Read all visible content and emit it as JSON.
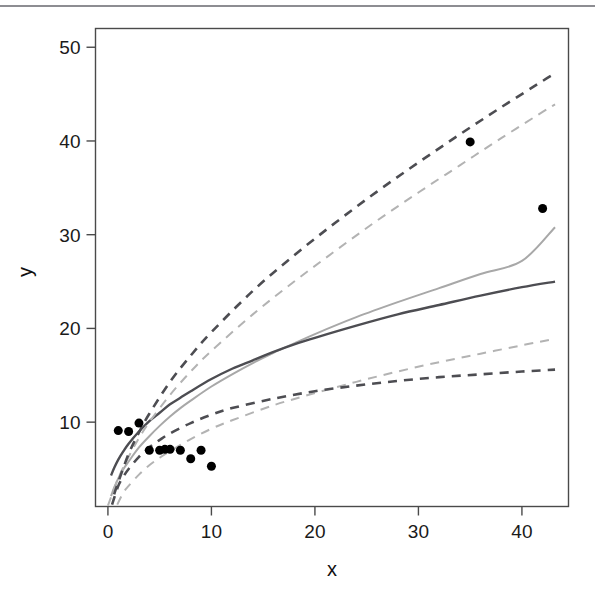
{
  "figure": {
    "background_color": "#ffffff",
    "top_rule_color": "#8d8d92",
    "plot_frame_color": "#4a4a4a"
  },
  "chart_data": {
    "type": "scatter",
    "title": "",
    "subtitle": "",
    "xlabel": "x",
    "ylabel": "y",
    "xlim": [
      -1.2,
      44.5
    ],
    "ylim": [
      1.0,
      52.0
    ],
    "xticks": [
      0,
      10,
      20,
      30,
      40
    ],
    "xticklabels": [
      "0",
      "10",
      "20",
      "30",
      "40"
    ],
    "yticks": [
      10,
      20,
      30,
      40,
      50
    ],
    "yticklabels": [
      "10",
      "20",
      "30",
      "40",
      "50"
    ],
    "grid": false,
    "legend": null,
    "legend_position": "none",
    "annotations": [],
    "points": {
      "name": "observed data",
      "marker": "filled-circle",
      "color": "#000000",
      "size": 9,
      "x": [
        1.0,
        2.0,
        3.0,
        4.0,
        5.0,
        5.5,
        6.0,
        7.0,
        8.0,
        9.0,
        10.0,
        35.0,
        42.0
      ],
      "y": [
        9.1,
        9.0,
        9.9,
        7.0,
        7.0,
        7.1,
        7.1,
        7.0,
        6.1,
        7.0,
        5.3,
        39.9,
        32.8
      ]
    },
    "series": [
      {
        "name": "fit-curve-light",
        "style": "solid",
        "color": "#a8a8a8",
        "width": 2.0,
        "x": [
          0.3,
          0.6,
          1,
          1.5,
          2,
          3,
          4,
          5,
          6,
          7,
          8,
          10,
          12,
          14,
          16,
          18,
          20,
          24,
          28,
          32,
          36,
          40,
          43.2
        ],
        "y": [
          2.1,
          3.0,
          4.0,
          5.0,
          5.8,
          7.3,
          8.5,
          9.6,
          10.6,
          11.5,
          12.3,
          13.8,
          15.1,
          16.3,
          17.4,
          18.4,
          19.4,
          21.2,
          22.8,
          24.3,
          25.8,
          27.2,
          30.8
        ]
      },
      {
        "name": "fit-curve-dark",
        "style": "solid",
        "color": "#4d4d52",
        "width": 2.4,
        "x": [
          0.3,
          0.6,
          1,
          1.5,
          2,
          3,
          4,
          5,
          6,
          7,
          8,
          10,
          12,
          14,
          16,
          18,
          20,
          24,
          28,
          32,
          36,
          40,
          43.2
        ],
        "y": [
          4.3,
          5.1,
          6.0,
          6.9,
          7.7,
          9.0,
          10.1,
          11.0,
          11.9,
          12.6,
          13.3,
          14.6,
          15.7,
          16.6,
          17.5,
          18.3,
          19.0,
          20.3,
          21.5,
          22.5,
          23.5,
          24.4,
          25.0
        ]
      },
      {
        "name": "upper-band-light-dashed",
        "style": "dashed",
        "color": "#b3b3b3",
        "width": 2.0,
        "x": [
          0.0,
          1,
          2,
          3,
          4,
          6,
          8,
          10,
          14,
          18,
          22,
          26,
          30,
          34,
          38,
          42,
          43.2
        ],
        "y": [
          1.1,
          4.0,
          6.3,
          8.3,
          10.0,
          12.9,
          15.4,
          17.6,
          21.5,
          25.0,
          28.3,
          31.5,
          34.5,
          37.4,
          40.3,
          43.1,
          43.9
        ]
      },
      {
        "name": "upper-band-dark-dashed",
        "style": "dashed",
        "color": "#4d4d52",
        "width": 2.6,
        "x": [
          0.6,
          1,
          2,
          3,
          4,
          6,
          8,
          10,
          14,
          18,
          22,
          26,
          30,
          34,
          38,
          42,
          43.2
        ],
        "y": [
          2.3,
          3.6,
          6.6,
          8.9,
          10.9,
          14.3,
          17.1,
          19.6,
          24.0,
          27.8,
          31.3,
          34.6,
          37.7,
          40.7,
          43.6,
          46.4,
          47.2
        ]
      },
      {
        "name": "lower-band-light-dashed",
        "style": "dashed",
        "color": "#b3b3b3",
        "width": 2.0,
        "x": [
          0.9,
          1.5,
          2,
          3,
          4,
          5,
          6,
          8,
          10,
          12,
          16,
          20,
          24,
          28,
          32,
          36,
          40,
          43.2
        ],
        "y": [
          1.2,
          2.5,
          3.2,
          4.4,
          5.4,
          6.2,
          6.9,
          8.2,
          9.3,
          10.2,
          11.8,
          13.1,
          14.3,
          15.4,
          16.4,
          17.3,
          18.2,
          18.9
        ]
      },
      {
        "name": "lower-band-dark-dashed",
        "style": "dashed",
        "color": "#4d4d52",
        "width": 2.6,
        "x": [
          0.4,
          1,
          1.5,
          2,
          3,
          4,
          5,
          6,
          8,
          10,
          12,
          16,
          20,
          24,
          28,
          32,
          36,
          40,
          43.2
        ],
        "y": [
          1.2,
          3.2,
          4.2,
          5.0,
          6.3,
          7.3,
          8.1,
          8.8,
          9.9,
          10.8,
          11.5,
          12.5,
          13.3,
          13.9,
          14.4,
          14.8,
          15.1,
          15.4,
          15.6
        ]
      }
    ]
  }
}
